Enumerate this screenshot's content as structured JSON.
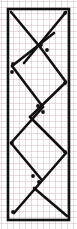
{
  "figure": {
    "background_color": "#ffffff",
    "grid_color": "#d7bec3",
    "grid_spacing_px": 6,
    "ink_color": "#111111",
    "frame": {
      "x": 8,
      "y": 9,
      "width": 61,
      "height": 211,
      "stroke_width": 2.6,
      "stroke_color": "#111111"
    },
    "members": [
      {
        "name": "diagonal-top-left-down",
        "x1": 11,
        "y1": 12,
        "x2": 40,
        "y2": 47,
        "stroke_width": 2.6
      },
      {
        "name": "diagonal-top-right-up",
        "x1": 24,
        "y1": 63,
        "x2": 66,
        "y2": 12,
        "stroke_width": 2.6
      },
      {
        "name": "diagonal-upper-left-down",
        "x1": 12,
        "y1": 66,
        "x2": 54,
        "y2": 33,
        "stroke_width": 2.6
      },
      {
        "name": "diagonal-upper-right-down",
        "x1": 40,
        "y1": 47,
        "x2": 66,
        "y2": 82,
        "stroke_width": 2.6
      },
      {
        "name": "diagonal-mid-left-up",
        "x1": 12,
        "y1": 66,
        "x2": 43,
        "y2": 107,
        "stroke_width": 2.6
      },
      {
        "name": "diagonal-mid-right-down",
        "x1": 66,
        "y1": 82,
        "x2": 30,
        "y2": 117,
        "stroke_width": 2.6
      },
      {
        "name": "diagonal-lower-left-down",
        "x1": 11,
        "y1": 143,
        "x2": 43,
        "y2": 107,
        "stroke_width": 2.6
      },
      {
        "name": "diagonal-lower-right-up",
        "x1": 30,
        "y1": 117,
        "x2": 66,
        "y2": 153,
        "stroke_width": 2.6
      },
      {
        "name": "diagonal-bottom-left-down",
        "x1": 11,
        "y1": 143,
        "x2": 41,
        "y2": 179,
        "stroke_width": 2.6
      },
      {
        "name": "diagonal-bottom-right-down",
        "x1": 66,
        "y1": 153,
        "x2": 14,
        "y2": 213,
        "stroke_width": 2.6
      },
      {
        "name": "diagonal-bottom-rise",
        "x1": 34,
        "y1": 188,
        "x2": 67,
        "y2": 216,
        "stroke_width": 2.6
      }
    ],
    "joints": [
      {
        "name": "joint-top-right-corner",
        "cx": 65,
        "cy": 13,
        "r": 1.9
      },
      {
        "name": "joint-upper-cross-left",
        "cx": 41,
        "cy": 45,
        "r": 1.9
      },
      {
        "name": "joint-upper-cross-right",
        "cx": 47,
        "cy": 50,
        "r": 1.9
      },
      {
        "name": "joint-left-upper",
        "cx": 13,
        "cy": 64,
        "r": 1.9
      },
      {
        "name": "joint-left-upper-lower",
        "cx": 12,
        "cy": 72,
        "r": 1.9
      },
      {
        "name": "joint-right-mid",
        "cx": 65,
        "cy": 83,
        "r": 1.9
      },
      {
        "name": "joint-center-cross-upper",
        "cx": 38,
        "cy": 106,
        "r": 1.9
      },
      {
        "name": "joint-center-cross-lower",
        "cx": 43,
        "cy": 112,
        "r": 1.9
      },
      {
        "name": "joint-left-lower",
        "cx": 12,
        "cy": 143,
        "r": 1.9
      },
      {
        "name": "joint-right-lower",
        "cx": 65,
        "cy": 152,
        "r": 1.9
      },
      {
        "name": "joint-bottom-cross-upper",
        "cx": 33,
        "cy": 176,
        "r": 1.9
      },
      {
        "name": "joint-bottom-cross-lower",
        "cx": 39,
        "cy": 182,
        "r": 1.9
      },
      {
        "name": "joint-bottom-left-corner",
        "cx": 13,
        "cy": 212,
        "r": 1.9
      }
    ]
  }
}
